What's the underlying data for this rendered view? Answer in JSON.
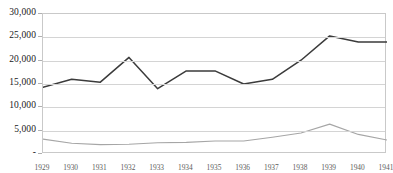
{
  "chart_data": {
    "type": "line",
    "title": "",
    "subtitle": "",
    "xlabel": "",
    "ylabel": "",
    "categories": [
      "1929",
      "1930",
      "1931",
      "1932",
      "1933",
      "1934",
      "1935",
      "1936",
      "1937",
      "1938",
      "1939",
      "1940",
      "1941"
    ],
    "ylim": [
      0,
      30000
    ],
    "ytick_values": [
      0,
      5000,
      10000,
      15000,
      20000,
      25000,
      30000
    ],
    "ytick_labels": [
      "-",
      "5,000",
      "10,000",
      "15,000",
      "20,000",
      "25,000",
      "30,000"
    ],
    "grid": true,
    "grid_axis": "y",
    "legend": false,
    "legend_position": "none",
    "series": [
      {
        "name": "series-1",
        "color": "#3b3b3b",
        "values": [
          14300,
          16000,
          15400,
          20700,
          14000,
          17800,
          17800,
          15000,
          16000,
          20100,
          25300,
          24000,
          24000
        ]
      },
      {
        "name": "series-2",
        "color": "#a6a6a6",
        "values": [
          3200,
          2300,
          2000,
          2100,
          2400,
          2500,
          2800,
          2800,
          3600,
          4500,
          6400,
          4200,
          3000
        ]
      }
    ]
  },
  "colors": {
    "series_1": "#3b3b3b",
    "series_2": "#a6a6a6",
    "gridline": "#d4d4d4",
    "plot_border": "#c9c9c9",
    "background": "#ffffff",
    "axis_text": "#1a1a1a",
    "x_axis_text": "#5c5c5c"
  }
}
